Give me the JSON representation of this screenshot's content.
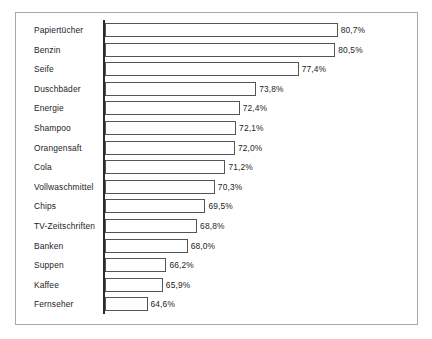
{
  "chart_data": {
    "type": "bar",
    "orientation": "horizontal",
    "title": "",
    "subtitle": "",
    "xlabel": "",
    "ylabel": "",
    "grid": false,
    "legend": false,
    "legend_position": "none",
    "value_suffix": "%",
    "decimal_separator": ",",
    "axis_origin_percent": 61.0,
    "axis_max_percent": 82.0,
    "categories": [
      "Papiertücher",
      "Benzin",
      "Seife",
      "Duschbäder",
      "Energie",
      "Shampoo",
      "Orangensaft",
      "Cola",
      "Vollwaschmittel",
      "Chips",
      "TV-Zeitschriften",
      "Banken",
      "Suppen",
      "Kaffee",
      "Fernseher"
    ],
    "values": [
      80.7,
      80.5,
      77.4,
      73.8,
      72.4,
      72.1,
      72.0,
      71.2,
      70.3,
      69.5,
      68.8,
      68.0,
      66.2,
      65.9,
      64.6
    ],
    "value_labels": [
      "80,7%",
      "80,5%",
      "77,4%",
      "73,8%",
      "72,4%",
      "72,1%",
      "72,0%",
      "71,2%",
      "70,3%",
      "69,5%",
      "68,8%",
      "68,0%",
      "66,2%",
      "65,9%",
      "64,6%"
    ],
    "colors": {
      "bar_fill": "#ffffff",
      "bar_border": "#545454",
      "axis": "#2b2b2b",
      "frame": "#a8a8a8",
      "text": "#1d1d1d"
    }
  }
}
